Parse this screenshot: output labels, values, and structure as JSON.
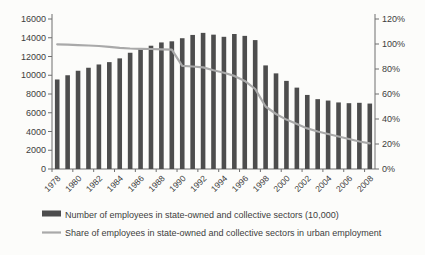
{
  "chart_data": {
    "type": "bar",
    "title": "",
    "x": [
      1978,
      1979,
      1980,
      1981,
      1982,
      1983,
      1984,
      1985,
      1986,
      1987,
      1988,
      1989,
      1990,
      1991,
      1992,
      1993,
      1994,
      1995,
      1996,
      1997,
      1998,
      1999,
      2000,
      2001,
      2002,
      2003,
      2004,
      2005,
      2006,
      2007,
      2008
    ],
    "x_tick_labels": [
      "1978",
      "1980",
      "1982",
      "1984",
      "1986",
      "1988",
      "1990",
      "1992",
      "1994",
      "1996",
      "1998",
      "2000",
      "2002",
      "2004",
      "2006",
      "2008"
    ],
    "series": [
      {
        "name": "Number of employees in state-owned and collective sectors (10,000)",
        "type": "bar",
        "axis": "left",
        "color": "#4d4d4d",
        "values": [
          9550,
          10000,
          10480,
          10800,
          11150,
          11400,
          11800,
          12400,
          12780,
          13150,
          13500,
          13620,
          13950,
          14300,
          14520,
          14330,
          14100,
          14400,
          14200,
          13750,
          11050,
          10200,
          9400,
          8680,
          7900,
          7450,
          7300,
          7100,
          7020,
          7060,
          6980
        ]
      },
      {
        "name": "Share of employees in state-owned and collective sectors in urban employment",
        "type": "line",
        "axis": "right",
        "color": "#a9a9a9",
        "values": [
          99.8,
          99.5,
          99.1,
          98.8,
          98.4,
          97.8,
          97.0,
          96.4,
          96.2,
          96.0,
          95.8,
          95.5,
          82.5,
          82.0,
          81.3,
          79.0,
          77.0,
          74.5,
          70.5,
          64.0,
          50.0,
          44.0,
          39.5,
          36.0,
          32.5,
          30.0,
          28.0,
          26.0,
          24.0,
          22.0,
          20.5
        ]
      }
    ],
    "left_axis": {
      "min": 0,
      "max": 16000,
      "step": 2000,
      "tick_labels": [
        "0",
        "2000",
        "4000",
        "6000",
        "8000",
        "10000",
        "12000",
        "14000",
        "16000"
      ]
    },
    "right_axis": {
      "min": 0,
      "max": 120,
      "step": 20,
      "tick_labels": [
        "0%",
        "20%",
        "40%",
        "60%",
        "80%",
        "100%",
        "120%"
      ]
    },
    "grid": false,
    "legend_position": "bottom-left",
    "colors": {
      "axis": "#6e6e6e",
      "text": "#3d3d3d",
      "background": "#fcfcfa"
    }
  }
}
